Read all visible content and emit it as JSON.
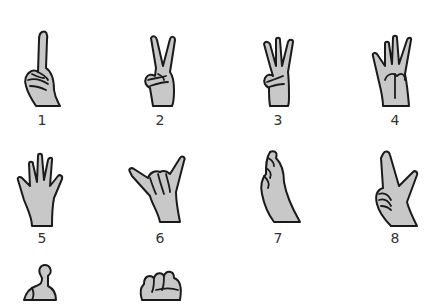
{
  "figure": {
    "fill_color": "#c8c8c8",
    "outline_color": "#1a1a1a",
    "label_color": "#333333",
    "gestures": [
      {
        "number": "1",
        "name": "index-finger-up"
      },
      {
        "number": "2",
        "name": "v-sign"
      },
      {
        "number": "3",
        "name": "three-fingers"
      },
      {
        "number": "4",
        "name": "four-fingers"
      },
      {
        "number": "5",
        "name": "open-hand"
      },
      {
        "number": "6",
        "name": "shaka-thumb-pinky"
      },
      {
        "number": "7",
        "name": "pinched-fingertips"
      },
      {
        "number": "8",
        "name": "thumb-index-l"
      },
      {
        "number": "",
        "name": "hooked-index-partial"
      },
      {
        "number": "",
        "name": "fist-partial"
      }
    ]
  }
}
